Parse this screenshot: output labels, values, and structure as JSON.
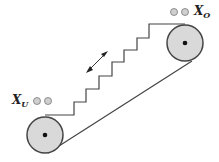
{
  "diagram": {
    "labels": {
      "upper": {
        "main": "X",
        "sub": "O"
      },
      "lower": {
        "main": "X",
        "sub": "U"
      }
    },
    "elements": [
      "upper-pulley",
      "lower-pulley",
      "stair-profile",
      "return-belt",
      "direction-arrow",
      "passenger-markers-upper",
      "passenger-markers-lower"
    ],
    "colors": {
      "line": "#444444",
      "pulley_fill": "#d9d9d9",
      "marker_fill": "#cfcfcf"
    }
  }
}
